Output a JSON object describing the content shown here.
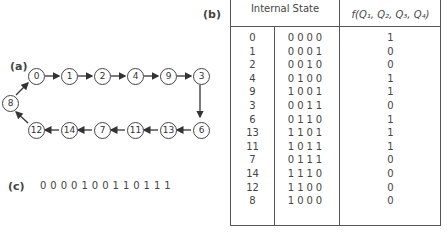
{
  "labels": {
    "a": "(a)",
    "b": "(b)",
    "c": "(c)"
  },
  "table": {
    "header_state": "Internal State",
    "header_output": "f(Q₁, Q₂, Q₃, Q₄)",
    "rows": [
      {
        "state": "0",
        "bits": "0000",
        "f": "1"
      },
      {
        "state": "1",
        "bits": "0001",
        "f": "0"
      },
      {
        "state": "2",
        "bits": "0010",
        "f": "0"
      },
      {
        "state": "4",
        "bits": "0100",
        "f": "1"
      },
      {
        "state": "9",
        "bits": "1001",
        "f": "1"
      },
      {
        "state": "3",
        "bits": "0011",
        "f": "0"
      },
      {
        "state": "6",
        "bits": "0110",
        "f": "1"
      },
      {
        "state": "13",
        "bits": "1101",
        "f": "1"
      },
      {
        "state": "11",
        "bits": "1011",
        "f": "1"
      },
      {
        "state": "7",
        "bits": "0111",
        "f": "0"
      },
      {
        "state": "14",
        "bits": "1110",
        "f": "0"
      },
      {
        "state": "12",
        "bits": "1100",
        "f": "0"
      },
      {
        "state": "8",
        "bits": "1000",
        "f": "0"
      }
    ]
  },
  "diagram": {
    "nodes": [
      "0",
      "1",
      "2",
      "4",
      "9",
      "3",
      "6",
      "13",
      "11",
      "7",
      "14",
      "12",
      "8"
    ]
  },
  "sequence": "0000100110111"
}
